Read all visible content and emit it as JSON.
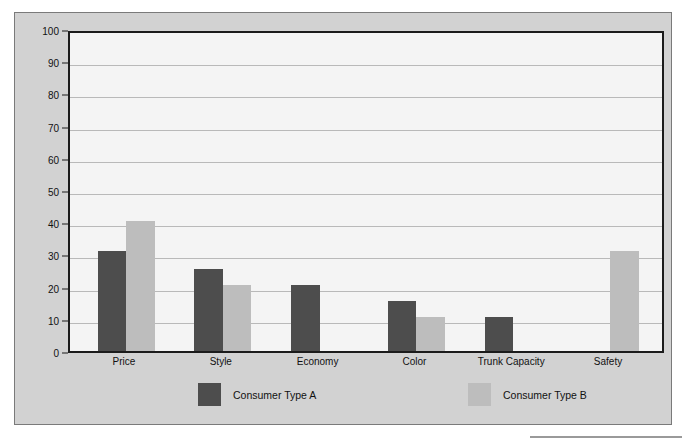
{
  "chart_data": {
    "type": "bar",
    "title": "",
    "xlabel": "",
    "ylabel": "Importance Points",
    "ylim": [
      0,
      100
    ],
    "ytick_step": 10,
    "yticks": [
      0,
      10,
      20,
      30,
      40,
      50,
      60,
      70,
      80,
      90,
      100
    ],
    "ytick_labels": [
      "0",
      "10",
      "20",
      "30",
      "40",
      "50",
      "60",
      "70",
      "80",
      "90",
      "100"
    ],
    "grid": "horizontal",
    "legend_position": "bottom",
    "categories": [
      "Price",
      "Style",
      "Economy",
      "Color",
      "Trunk Capacity",
      "Safety"
    ],
    "series": [
      {
        "name": "Consumer Type A",
        "color": "#4d4d4d",
        "values": [
          31,
          25.5,
          20.5,
          15.5,
          10.5,
          0
        ]
      },
      {
        "name": "Consumer Type B",
        "color": "#bdbdbd",
        "values": [
          40.5,
          20.5,
          0,
          10.5,
          0,
          31
        ]
      }
    ]
  },
  "figure": {
    "background_color": "#d2d2d2",
    "plot_background_color": "#f4f4f4",
    "axis_color": "#1b1b1b",
    "gridline_color": "#b9b9b9"
  }
}
